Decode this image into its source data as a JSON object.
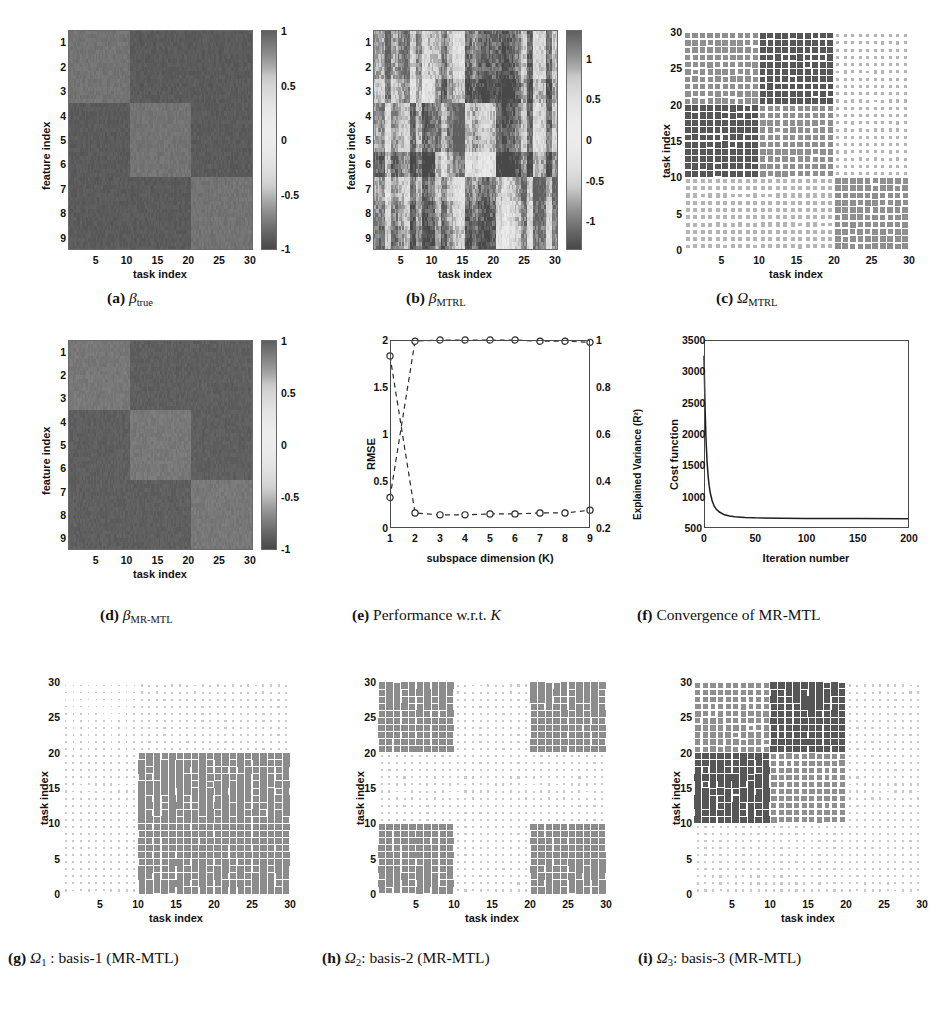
{
  "figure": {
    "background": "#ffffff",
    "grid": {
      "rows": 3,
      "cols": 3
    }
  },
  "common": {
    "task_index_label": "task index",
    "feature_index_label": "feature index",
    "task_ticks": [
      "5",
      "10",
      "15",
      "20",
      "25",
      "30"
    ],
    "feature_ticks": [
      "1",
      "2",
      "3",
      "4",
      "5",
      "6",
      "7",
      "8",
      "9"
    ],
    "omega_ticks": [
      "0",
      "5",
      "10",
      "15",
      "20",
      "25",
      "30"
    ],
    "colorbar_ticks_ab": [
      "1",
      "0.5",
      "0",
      "-0.5",
      "-1"
    ]
  },
  "panels": [
    {
      "id": "a",
      "letter": "(a)",
      "caption_var": "β",
      "caption_sub": "true",
      "type": "heatmap",
      "xlabel": "task index",
      "ylabel": "feature index",
      "colorbar": {
        "ticks": [
          "1",
          "0.5",
          "0",
          "-0.5",
          "-1"
        ],
        "vmin": -1,
        "vmax": 1
      },
      "chart_data": {
        "type": "heatmap",
        "title": "β_true",
        "xlabel": "task index",
        "ylabel": "feature index",
        "xlim": [
          1,
          30
        ],
        "ylim": [
          1,
          9
        ],
        "zlim": [
          -1,
          1
        ],
        "block_structure": "3x3 block-diagonal: feature rows 1-3 positive on tasks 1-10, rows 4-6 positive on tasks 11-20, rows 7-9 positive on tasks 21-30; all other blocks negative",
        "blocks": [
          {
            "rows": [
              1,
              3
            ],
            "cols": [
              1,
              10
            ],
            "value": 0.9
          },
          {
            "rows": [
              1,
              3
            ],
            "cols": [
              11,
              30
            ],
            "value": -0.9
          },
          {
            "rows": [
              4,
              6
            ],
            "cols": [
              1,
              10
            ],
            "value": -0.9
          },
          {
            "rows": [
              4,
              6
            ],
            "cols": [
              11,
              20
            ],
            "value": 0.9
          },
          {
            "rows": [
              4,
              6
            ],
            "cols": [
              21,
              30
            ],
            "value": -0.9
          },
          {
            "rows": [
              7,
              9
            ],
            "cols": [
              1,
              20
            ],
            "value": -0.9
          },
          {
            "rows": [
              7,
              9
            ],
            "cols": [
              21,
              30
            ],
            "value": 0.9
          }
        ]
      }
    },
    {
      "id": "b",
      "letter": "(b)",
      "caption_var": "β",
      "caption_sub": "MTRL",
      "type": "heatmap",
      "xlabel": "task index",
      "ylabel": "feature index",
      "colorbar": {
        "ticks": [
          "1",
          "0.5",
          "0",
          "-0.5",
          "-1"
        ],
        "vmin": -1.35,
        "vmax": 1.35
      },
      "chart_data": {
        "type": "heatmap",
        "title": "β_MTRL",
        "xlabel": "task index",
        "ylabel": "feature index",
        "xlim": [
          1,
          30
        ],
        "ylim": [
          1,
          9
        ],
        "zlim": [
          -1.35,
          1.35
        ],
        "block_structure": "Same 3x3 block pattern as beta_true but noisy, with column-wise striping and blurred block edges",
        "noise_level": 0.45
      }
    },
    {
      "id": "c",
      "letter": "(c)",
      "caption_var": "Ω",
      "caption_sub": "MTRL",
      "type": "hinton",
      "xlabel": "task index",
      "ylabel": "task index",
      "chart_data": {
        "type": "heatmap",
        "title": "Ω_MTRL",
        "xlabel": "task index",
        "ylabel": "task index",
        "xlim": [
          0,
          30
        ],
        "ylim": [
          0,
          30
        ],
        "rendering": "Hinton-style square-size map, 30x30 task covariance",
        "blocks": [
          {
            "rows": [
              21,
              30
            ],
            "cols": [
              1,
              10
            ],
            "magnitude": 0.62,
            "shade": "medium"
          },
          {
            "rows": [
              21,
              30
            ],
            "cols": [
              11,
              20
            ],
            "magnitude": 0.72,
            "shade": "dark"
          },
          {
            "rows": [
              21,
              30
            ],
            "cols": [
              21,
              30
            ],
            "magnitude": 0.2,
            "shade": "light"
          },
          {
            "rows": [
              11,
              20
            ],
            "cols": [
              1,
              10
            ],
            "magnitude": 0.78,
            "shade": "dark"
          },
          {
            "rows": [
              11,
              20
            ],
            "cols": [
              11,
              20
            ],
            "magnitude": 0.6,
            "shade": "medium"
          },
          {
            "rows": [
              11,
              20
            ],
            "cols": [
              21,
              30
            ],
            "magnitude": 0.22,
            "shade": "light"
          },
          {
            "rows": [
              1,
              10
            ],
            "cols": [
              1,
              10
            ],
            "magnitude": 0.34,
            "shade": "light"
          },
          {
            "rows": [
              1,
              10
            ],
            "cols": [
              11,
              20
            ],
            "magnitude": 0.36,
            "shade": "light"
          },
          {
            "rows": [
              1,
              10
            ],
            "cols": [
              21,
              30
            ],
            "magnitude": 0.66,
            "shade": "medium"
          }
        ]
      }
    },
    {
      "id": "d",
      "letter": "(d)",
      "caption_var": "β",
      "caption_sub": "MR-MTL",
      "type": "heatmap",
      "xlabel": "task index",
      "ylabel": "feature index",
      "colorbar": {
        "ticks": [
          "1",
          "0.5",
          "0",
          "-0.5",
          "-1"
        ],
        "vmin": -1,
        "vmax": 1
      },
      "chart_data": {
        "type": "heatmap",
        "title": "β_MR-MTL",
        "xlabel": "task index",
        "ylabel": "feature index",
        "xlim": [
          1,
          30
        ],
        "ylim": [
          1,
          9
        ],
        "zlim": [
          -1,
          1
        ],
        "block_structure": "Recovers the clean 3x3 block-diagonal structure of beta_true",
        "blocks": [
          {
            "rows": [
              1,
              3
            ],
            "cols": [
              1,
              10
            ],
            "value": 0.88
          },
          {
            "rows": [
              1,
              3
            ],
            "cols": [
              11,
              30
            ],
            "value": -0.88
          },
          {
            "rows": [
              4,
              6
            ],
            "cols": [
              1,
              10
            ],
            "value": -0.88
          },
          {
            "rows": [
              4,
              6
            ],
            "cols": [
              11,
              20
            ],
            "value": 0.88
          },
          {
            "rows": [
              4,
              6
            ],
            "cols": [
              21,
              30
            ],
            "value": -0.88
          },
          {
            "rows": [
              7,
              9
            ],
            "cols": [
              1,
              20
            ],
            "value": -0.88
          },
          {
            "rows": [
              7,
              9
            ],
            "cols": [
              21,
              30
            ],
            "value": 0.88
          }
        ]
      }
    },
    {
      "id": "e",
      "letter": "(e)",
      "caption_text": "Performance w.r.t. ",
      "caption_var": "K",
      "type": "lineplot",
      "xlabel": "subspace dimension (K)",
      "ylabel_left": "RMSE",
      "ylabel_right": "Explained Variance (R²)",
      "chart_data": {
        "type": "line",
        "title": "Performance w.r.t. K",
        "xlabel": "subspace dimension (K)",
        "ylabel": "RMSE",
        "ylabel_right": "Explained Variance (R²)",
        "x": [
          1,
          2,
          3,
          4,
          5,
          6,
          7,
          8,
          9
        ],
        "xlim": [
          1,
          9
        ],
        "ylim": [
          0,
          2
        ],
        "ylim_right": [
          0.2,
          1.0
        ],
        "yticks": [
          "0",
          "0.5",
          "1",
          "1.5",
          "2"
        ],
        "yticks_right": [
          "0.2",
          "0.4",
          "0.6",
          "0.8",
          "1"
        ],
        "xticks": [
          "1",
          "2",
          "3",
          "4",
          "5",
          "6",
          "7",
          "8",
          "9"
        ],
        "grid": false,
        "linestyle": "dashed",
        "marker": "circle",
        "series": [
          {
            "name": "RMSE",
            "axis": "left",
            "values": [
              1.83,
              0.16,
              0.14,
              0.14,
              0.15,
              0.15,
              0.16,
              0.16,
              0.19
            ]
          },
          {
            "name": "Explained Variance (R²)",
            "axis": "right",
            "values": [
              0.33,
              0.995,
              1.0,
              1.0,
              1.0,
              1.0,
              0.995,
              0.995,
              0.99
            ]
          }
        ]
      }
    },
    {
      "id": "f",
      "letter": "(f)",
      "caption_text": "Convergence of MR-MTL",
      "type": "lineplot",
      "xlabel": "Iteration number",
      "ylabel_left": "Cost function",
      "chart_data": {
        "type": "line",
        "title": "Convergence of MR-MTL",
        "xlabel": "Iteration number",
        "ylabel": "Cost function",
        "xlim": [
          0,
          200
        ],
        "ylim": [
          500,
          3500
        ],
        "xticks": [
          "0",
          "50",
          "100",
          "150",
          "200"
        ],
        "yticks": [
          "500",
          "1000",
          "1500",
          "2000",
          "2500",
          "3000",
          "3500"
        ],
        "grid": false,
        "linestyle": "solid",
        "series": [
          {
            "name": "Cost function",
            "x": [
              0,
              1,
              2,
              3,
              4,
              5,
              6,
              8,
              10,
              12,
              15,
              20,
              25,
              30,
              40,
              50,
              75,
              100,
              150,
              200
            ],
            "values": [
              3250,
              2450,
              1900,
              1560,
              1330,
              1180,
              1070,
              930,
              850,
              800,
              755,
              710,
              690,
              678,
              668,
              662,
              656,
              653,
              650,
              648
            ]
          }
        ]
      }
    },
    {
      "id": "g",
      "letter": "(g)",
      "caption_var": "Ω",
      "caption_sub": "1",
      "caption_text": " :   basis-1 (MR-MTL)",
      "type": "hinton",
      "xlabel": "task index",
      "ylabel": "task index",
      "chart_data": {
        "type": "heatmap",
        "title": "Ω_1 : basis-1 (MR-MTL)",
        "xlabel": "task index",
        "ylabel": "task index",
        "xlim": [
          0,
          30
        ],
        "ylim": [
          0,
          30
        ],
        "rendering": "Hinton-style square-size map, 30x30 basis component",
        "blocks": [
          {
            "rows": [
              1,
              20
            ],
            "cols": [
              11,
              30
            ],
            "magnitude": 0.95,
            "shade": "strong"
          },
          {
            "rows": [
              21,
              30
            ],
            "cols": [
              11,
              30
            ],
            "magnitude": 0.1,
            "shade": "faint"
          },
          {
            "rows": [
              1,
              20
            ],
            "cols": [
              1,
              10
            ],
            "magnitude": 0.09,
            "shade": "faint"
          },
          {
            "rows": [
              21,
              30
            ],
            "cols": [
              1,
              10
            ],
            "magnitude": 0.05,
            "shade": "faint"
          }
        ]
      }
    },
    {
      "id": "h",
      "letter": "(h)",
      "caption_var": "Ω",
      "caption_sub": "2",
      "caption_text": ": basis-2 (MR-MTL)",
      "type": "hinton",
      "xlabel": "task index",
      "ylabel": "task index",
      "chart_data": {
        "type": "heatmap",
        "title": "Ω_2: basis-2 (MR-MTL)",
        "xlabel": "task index",
        "ylabel": "task index",
        "xlim": [
          0,
          30
        ],
        "ylim": [
          0,
          30
        ],
        "rendering": "Hinton-style square-size map, four corner blocks active",
        "blocks": [
          {
            "rows": [
              1,
              10
            ],
            "cols": [
              1,
              10
            ],
            "magnitude": 0.95,
            "shade": "strong"
          },
          {
            "rows": [
              1,
              10
            ],
            "cols": [
              21,
              30
            ],
            "magnitude": 0.95,
            "shade": "strong"
          },
          {
            "rows": [
              21,
              30
            ],
            "cols": [
              1,
              10
            ],
            "magnitude": 0.95,
            "shade": "strong"
          },
          {
            "rows": [
              21,
              30
            ],
            "cols": [
              21,
              30
            ],
            "magnitude": 0.95,
            "shade": "strong"
          },
          {
            "rows": [
              11,
              20
            ],
            "cols": [
              1,
              30
            ],
            "magnitude": 0.1,
            "shade": "faint"
          },
          {
            "rows": [
              1,
              30
            ],
            "cols": [
              11,
              20
            ],
            "magnitude": 0.1,
            "shade": "faint"
          }
        ]
      }
    },
    {
      "id": "i",
      "letter": "(i)",
      "caption_var": "Ω",
      "caption_sub": "3",
      "caption_text": ": basis-3 (MR-MTL)",
      "type": "hinton",
      "xlabel": "task index",
      "ylabel": "task index",
      "chart_data": {
        "type": "heatmap",
        "title": "Ω_3: basis-3 (MR-MTL)",
        "xlabel": "task index",
        "ylabel": "task index",
        "xlim": [
          0,
          30
        ],
        "ylim": [
          0,
          30
        ],
        "rendering": "Hinton-style square-size map, upper-left quadrant active with dark sub-blocks",
        "blocks": [
          {
            "rows": [
              21,
              30
            ],
            "cols": [
              1,
              10
            ],
            "magnitude": 0.62,
            "shade": "medium"
          },
          {
            "rows": [
              21,
              30
            ],
            "cols": [
              11,
              20
            ],
            "magnitude": 0.92,
            "shade": "dark"
          },
          {
            "rows": [
              11,
              20
            ],
            "cols": [
              1,
              10
            ],
            "magnitude": 0.92,
            "shade": "dark"
          },
          {
            "rows": [
              11,
              20
            ],
            "cols": [
              11,
              20
            ],
            "magnitude": 0.6,
            "shade": "medium"
          },
          {
            "rows": [
              1,
              10
            ],
            "cols": [
              1,
              20
            ],
            "magnitude": 0.12,
            "shade": "faint"
          },
          {
            "rows": [
              1,
              30
            ],
            "cols": [
              21,
              30
            ],
            "magnitude": 0.1,
            "shade": "faint"
          }
        ]
      }
    }
  ]
}
